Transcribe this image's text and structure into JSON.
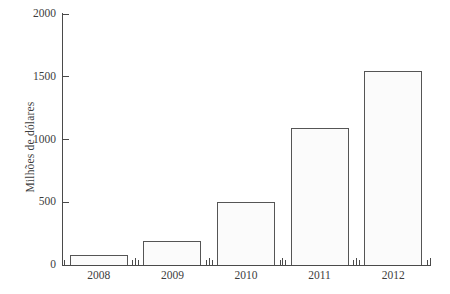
{
  "chart_data": {
    "type": "bar",
    "title": "",
    "xlabel": "",
    "ylabel": "Milhões de dólares",
    "categories": [
      "2008",
      "2009",
      "2010",
      "2011",
      "2012"
    ],
    "values": [
      80,
      190,
      505,
      1090,
      1545
    ],
    "ylim": [
      0,
      2000
    ],
    "yticks": [
      0,
      500,
      1000,
      1500,
      2000
    ],
    "ytick_labels": [
      "0",
      "500",
      "1000",
      "1500",
      "2000"
    ],
    "grid": false,
    "legend": null,
    "series": [
      {
        "name": "Milhões de dólares",
        "values": [
          80,
          190,
          505,
          1090,
          1545
        ]
      }
    ],
    "bar_fill_color": "#fbfbfb",
    "bar_edge_color": "#555555",
    "axis_color": "#4a4a4a",
    "background_color": "#ffffff"
  },
  "axis": {
    "y_title": "Milhões de dólares",
    "ticks_y": [
      {
        "label": "2000",
        "value": 2000
      },
      {
        "label": "1500",
        "value": 1500
      },
      {
        "label": "1000",
        "value": 1000
      },
      {
        "label": "500",
        "value": 500
      },
      {
        "label": "0",
        "value": 0
      }
    ],
    "ticks_x": [
      {
        "label": "2008"
      },
      {
        "label": "2009"
      },
      {
        "label": "2010"
      },
      {
        "label": "2011"
      },
      {
        "label": "2012"
      }
    ]
  }
}
